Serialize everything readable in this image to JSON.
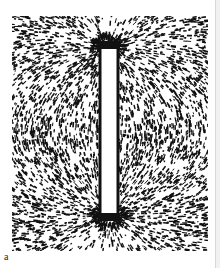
{
  "figure": {
    "panel_label": "a",
    "colors": {
      "ink": "#111111",
      "paper": "#ffffff"
    }
  }
}
